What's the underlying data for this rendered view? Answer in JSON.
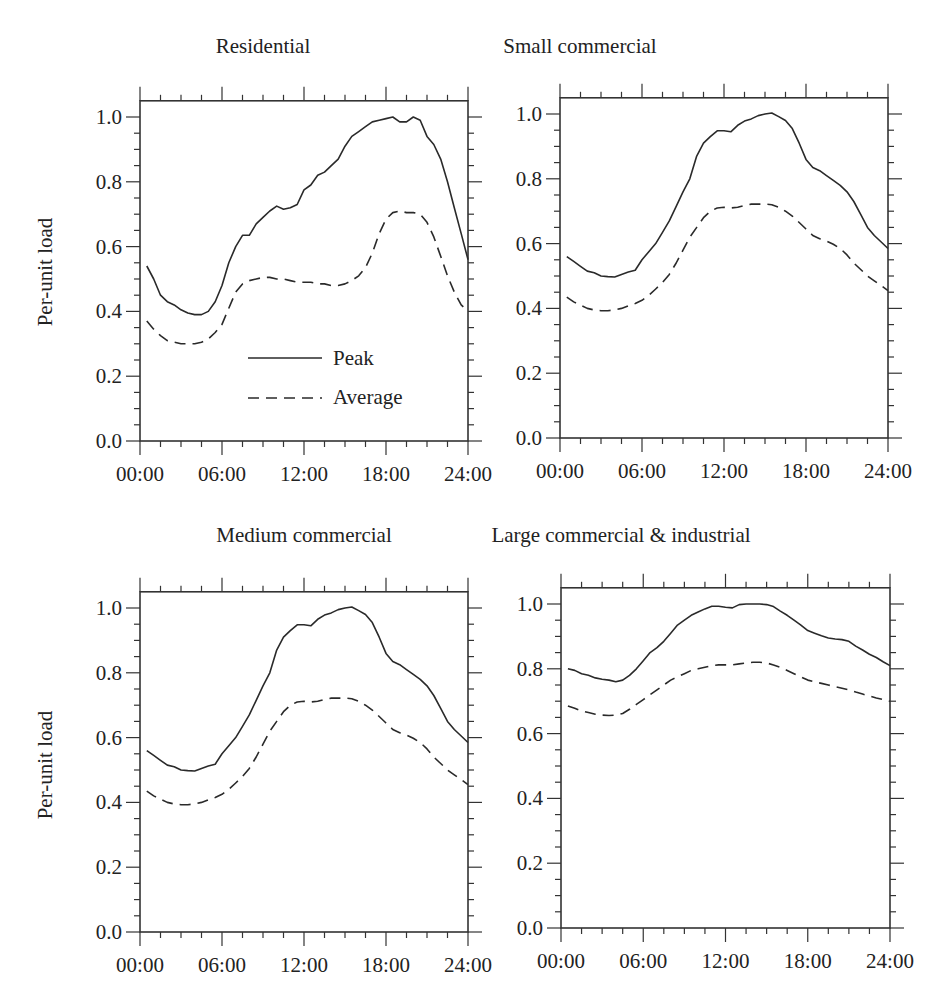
{
  "figure": {
    "ylabel": "Per-unit load",
    "legend": {
      "peak_label": "Peak",
      "average_label": "Average"
    },
    "colors": {
      "line": "#2a2a2a",
      "axis": "#333333",
      "background": "#ffffff"
    }
  },
  "chart_data": [
    {
      "type": "line",
      "title": "Residential",
      "xlabel": "",
      "ylabel": "Per-unit load",
      "xlim": [
        0,
        24
      ],
      "ylim": [
        0,
        1.05
      ],
      "x_tick_labels": [
        "00:00",
        "06:00",
        "12:00",
        "18:00",
        "24:00"
      ],
      "y_tick_labels": [
        "0.0",
        "0.2",
        "0.4",
        "0.6",
        "0.8",
        "1.0"
      ],
      "legend": [
        "Peak",
        "Average"
      ],
      "legend_position": "lower center inside",
      "grid": false,
      "x": [
        0.5,
        1,
        1.5,
        2,
        2.5,
        3,
        3.5,
        4,
        4.5,
        5,
        5.5,
        6,
        6.5,
        7,
        7.5,
        8,
        8.5,
        9,
        9.5,
        10,
        10.5,
        11,
        11.5,
        12,
        12.5,
        13,
        13.5,
        14,
        14.5,
        15,
        15.5,
        16,
        16.5,
        17,
        17.5,
        18,
        18.5,
        19,
        19.5,
        20,
        20.5,
        21,
        21.5,
        22,
        22.5,
        23,
        23.5,
        24
      ],
      "series": [
        {
          "name": "Peak",
          "style": "solid",
          "values": [
            0.54,
            0.5,
            0.45,
            0.43,
            0.42,
            0.405,
            0.395,
            0.39,
            0.39,
            0.4,
            0.43,
            0.48,
            0.55,
            0.6,
            0.635,
            0.635,
            0.67,
            0.69,
            0.71,
            0.725,
            0.715,
            0.72,
            0.73,
            0.775,
            0.79,
            0.82,
            0.83,
            0.85,
            0.87,
            0.91,
            0.94,
            0.955,
            0.97,
            0.985,
            0.99,
            0.995,
            1.0,
            0.985,
            0.985,
            1.0,
            0.99,
            0.94,
            0.915,
            0.87,
            0.8,
            0.72,
            0.64,
            0.56
          ]
        },
        {
          "name": "Average",
          "style": "dashed",
          "values": [
            0.37,
            0.345,
            0.325,
            0.31,
            0.305,
            0.3,
            0.3,
            0.3,
            0.305,
            0.315,
            0.335,
            0.36,
            0.41,
            0.46,
            0.485,
            0.495,
            0.5,
            0.505,
            0.505,
            0.5,
            0.5,
            0.495,
            0.49,
            0.49,
            0.49,
            0.485,
            0.485,
            0.48,
            0.48,
            0.485,
            0.495,
            0.51,
            0.535,
            0.58,
            0.64,
            0.685,
            0.705,
            0.71,
            0.705,
            0.705,
            0.7,
            0.675,
            0.63,
            0.57,
            0.51,
            0.46,
            0.42,
            0.4
          ]
        }
      ]
    },
    {
      "type": "line",
      "title": "Small commercial",
      "xlabel": "",
      "ylabel": "",
      "xlim": [
        0,
        24
      ],
      "ylim": [
        0,
        1.05
      ],
      "x_tick_labels": [
        "00:00",
        "06:00",
        "12:00",
        "18:00",
        "24:00"
      ],
      "y_tick_labels": [
        "0.0",
        "0.2",
        "0.4",
        "0.6",
        "0.8",
        "1.0"
      ],
      "grid": false,
      "x": [
        0.5,
        1,
        1.5,
        2,
        2.5,
        3,
        3.5,
        4,
        4.5,
        5,
        5.5,
        6,
        6.5,
        7,
        7.5,
        8,
        8.5,
        9,
        9.5,
        10,
        10.5,
        11,
        11.5,
        12,
        12.5,
        13,
        13.5,
        14,
        14.5,
        15,
        15.5,
        16,
        16.5,
        17,
        17.5,
        18,
        18.5,
        19,
        19.5,
        20,
        20.5,
        21,
        21.5,
        22,
        22.5,
        23,
        23.5,
        24
      ],
      "series": [
        {
          "name": "Peak",
          "style": "solid",
          "values": [
            0.56,
            0.545,
            0.53,
            0.515,
            0.51,
            0.5,
            0.498,
            0.497,
            0.505,
            0.512,
            0.518,
            0.55,
            0.575,
            0.6,
            0.635,
            0.67,
            0.715,
            0.76,
            0.8,
            0.87,
            0.91,
            0.93,
            0.948,
            0.948,
            0.945,
            0.965,
            0.978,
            0.985,
            0.995,
            1.0,
            1.003,
            0.992,
            0.98,
            0.955,
            0.91,
            0.86,
            0.835,
            0.825,
            0.81,
            0.795,
            0.78,
            0.76,
            0.73,
            0.69,
            0.65,
            0.625,
            0.605,
            0.585
          ]
        },
        {
          "name": "Average",
          "style": "dashed",
          "values": [
            0.435,
            0.42,
            0.41,
            0.4,
            0.395,
            0.393,
            0.393,
            0.395,
            0.4,
            0.408,
            0.415,
            0.425,
            0.44,
            0.46,
            0.48,
            0.505,
            0.54,
            0.58,
            0.62,
            0.65,
            0.68,
            0.7,
            0.71,
            0.712,
            0.71,
            0.712,
            0.718,
            0.722,
            0.722,
            0.722,
            0.72,
            0.712,
            0.7,
            0.685,
            0.665,
            0.645,
            0.625,
            0.615,
            0.608,
            0.598,
            0.585,
            0.565,
            0.54,
            0.52,
            0.5,
            0.485,
            0.47,
            0.455
          ]
        }
      ]
    },
    {
      "type": "line",
      "title": "Medium commercial",
      "xlabel": "",
      "ylabel": "Per-unit load",
      "xlim": [
        0,
        24
      ],
      "ylim": [
        0,
        1.05
      ],
      "x_tick_labels": [
        "00:00",
        "06:00",
        "12:00",
        "18:00",
        "24:00"
      ],
      "y_tick_labels": [
        "0.0",
        "0.2",
        "0.4",
        "0.6",
        "0.8",
        "1.0"
      ],
      "grid": false,
      "x": [
        0.5,
        1,
        1.5,
        2,
        2.5,
        3,
        3.5,
        4,
        4.5,
        5,
        5.5,
        6,
        6.5,
        7,
        7.5,
        8,
        8.5,
        9,
        9.5,
        10,
        10.5,
        11,
        11.5,
        12,
        12.5,
        13,
        13.5,
        14,
        14.5,
        15,
        15.5,
        16,
        16.5,
        17,
        17.5,
        18,
        18.5,
        19,
        19.5,
        20,
        20.5,
        21,
        21.5,
        22,
        22.5,
        23,
        23.5,
        24
      ],
      "series": [
        {
          "name": "Peak",
          "style": "solid",
          "values": [
            0.56,
            0.545,
            0.53,
            0.515,
            0.51,
            0.5,
            0.498,
            0.497,
            0.505,
            0.512,
            0.518,
            0.55,
            0.575,
            0.6,
            0.635,
            0.67,
            0.715,
            0.76,
            0.8,
            0.87,
            0.91,
            0.93,
            0.948,
            0.948,
            0.945,
            0.965,
            0.978,
            0.985,
            0.995,
            1.0,
            1.003,
            0.992,
            0.98,
            0.955,
            0.91,
            0.86,
            0.835,
            0.825,
            0.81,
            0.795,
            0.78,
            0.76,
            0.73,
            0.69,
            0.65,
            0.625,
            0.605,
            0.585
          ]
        },
        {
          "name": "Average",
          "style": "dashed",
          "values": [
            0.435,
            0.42,
            0.41,
            0.4,
            0.395,
            0.393,
            0.393,
            0.395,
            0.4,
            0.408,
            0.415,
            0.425,
            0.44,
            0.46,
            0.48,
            0.505,
            0.54,
            0.58,
            0.62,
            0.65,
            0.68,
            0.7,
            0.71,
            0.712,
            0.71,
            0.712,
            0.718,
            0.722,
            0.722,
            0.722,
            0.72,
            0.712,
            0.7,
            0.685,
            0.665,
            0.645,
            0.625,
            0.615,
            0.608,
            0.598,
            0.585,
            0.565,
            0.54,
            0.52,
            0.5,
            0.485,
            0.47,
            0.455
          ]
        }
      ]
    },
    {
      "type": "line",
      "title": "Large commercial & industrial",
      "xlabel": "",
      "ylabel": "",
      "xlim": [
        0,
        24
      ],
      "ylim": [
        0,
        1.05
      ],
      "x_tick_labels": [
        "00:00",
        "06:00",
        "12:00",
        "18:00",
        "24:00"
      ],
      "y_tick_labels": [
        "0.0",
        "0.2",
        "0.4",
        "0.6",
        "0.8",
        "1.0"
      ],
      "grid": false,
      "x": [
        0.5,
        1,
        1.5,
        2,
        2.5,
        3,
        3.5,
        4,
        4.5,
        5,
        5.5,
        6,
        6.5,
        7,
        7.5,
        8,
        8.5,
        9,
        9.5,
        10,
        10.5,
        11,
        11.5,
        12,
        12.5,
        13,
        13.5,
        14,
        14.5,
        15,
        15.5,
        16,
        16.5,
        17,
        17.5,
        18,
        18.5,
        19,
        19.5,
        20,
        20.5,
        21,
        21.5,
        22,
        22.5,
        23,
        23.5,
        24
      ],
      "series": [
        {
          "name": "Peak",
          "style": "solid",
          "values": [
            0.8,
            0.795,
            0.785,
            0.78,
            0.772,
            0.768,
            0.765,
            0.76,
            0.765,
            0.78,
            0.8,
            0.825,
            0.85,
            0.865,
            0.885,
            0.91,
            0.935,
            0.95,
            0.965,
            0.975,
            0.985,
            0.993,
            0.993,
            0.99,
            0.988,
            0.998,
            1.0,
            1.0,
            1.0,
            0.998,
            0.992,
            0.978,
            0.965,
            0.95,
            0.935,
            0.918,
            0.91,
            0.902,
            0.895,
            0.892,
            0.89,
            0.885,
            0.87,
            0.858,
            0.845,
            0.835,
            0.822,
            0.81
          ]
        },
        {
          "name": "Average",
          "style": "dashed",
          "values": [
            0.685,
            0.678,
            0.67,
            0.665,
            0.66,
            0.657,
            0.656,
            0.657,
            0.662,
            0.675,
            0.69,
            0.705,
            0.72,
            0.735,
            0.75,
            0.765,
            0.775,
            0.785,
            0.795,
            0.8,
            0.805,
            0.81,
            0.812,
            0.812,
            0.812,
            0.815,
            0.818,
            0.82,
            0.82,
            0.818,
            0.812,
            0.805,
            0.795,
            0.785,
            0.775,
            0.765,
            0.76,
            0.755,
            0.75,
            0.745,
            0.74,
            0.735,
            0.728,
            0.722,
            0.716,
            0.71,
            0.705,
            0.7
          ]
        }
      ]
    }
  ],
  "layout": {
    "panels": [
      {
        "left": 140,
        "right": 468,
        "y0": 441,
        "y1": 117,
        "title_x": 263,
        "title_y": 34
      },
      {
        "left": 560,
        "right": 888,
        "y0": 438,
        "y1": 114,
        "title_x": 580,
        "title_y": 34
      },
      {
        "left": 140,
        "right": 468,
        "y0": 932,
        "y1": 608,
        "title_x": 304,
        "title_y": 523
      },
      {
        "left": 561,
        "right": 890,
        "y0": 928,
        "y1": 604,
        "title_x": 621,
        "title_y": 523
      }
    ]
  }
}
